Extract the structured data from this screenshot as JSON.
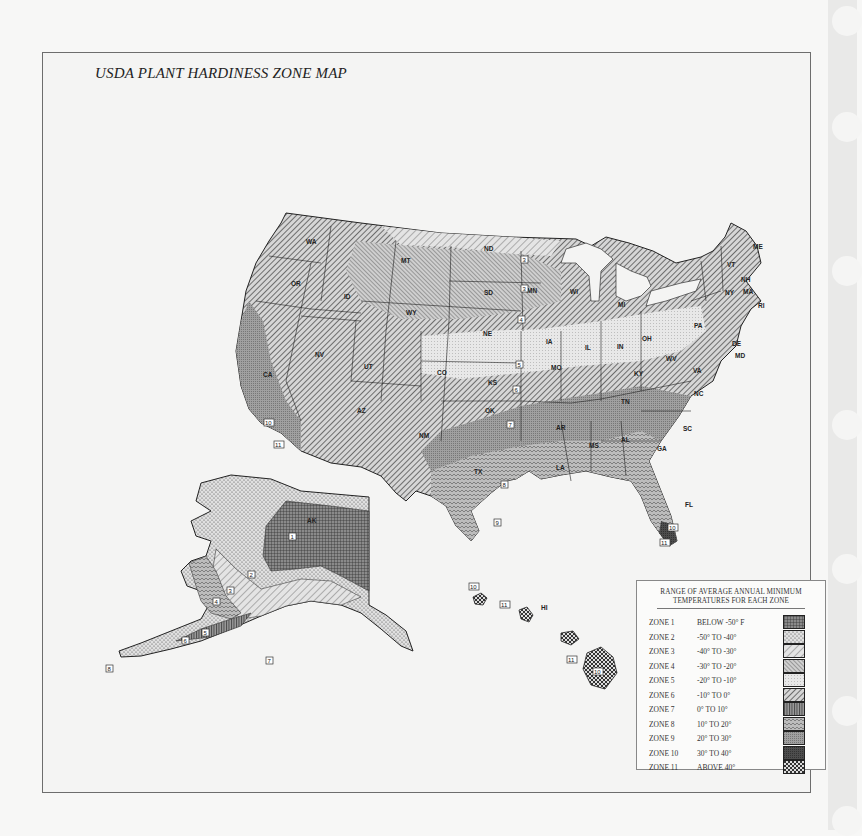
{
  "title": "USDA PLANT HARDINESS ZONE MAP",
  "colors": {
    "background": "#f7f7f6",
    "frame_border": "#6d6d6d",
    "sidebar": "#e9e9e8",
    "zone_shades": {
      "1": "#5c5c5c",
      "2": "#cfcfcf",
      "3": "#bdbdbd",
      "4": "#a8a8a8",
      "5": "#dedede",
      "6": "#c2c2c2",
      "7": "#7f7f7f",
      "8": "#a9a9a9",
      "9": "#959595",
      "10": "#4a4a4a",
      "11": "#6a6a6a"
    }
  },
  "legend": {
    "heading_line1": "RANGE OF AVERAGE ANNUAL MINIMUM",
    "heading_line2": "TEMPERATURES FOR EACH ZONE",
    "zones": [
      {
        "zone": "ZONE 1",
        "range": "BELOW  -50° F",
        "pattern": "grid"
      },
      {
        "zone": "ZONE 2",
        "range": "-50°  TO  -40°",
        "pattern": "dots"
      },
      {
        "zone": "ZONE 3",
        "range": "-40°  TO  -30°",
        "pattern": "sparse-diagonal"
      },
      {
        "zone": "ZONE 4",
        "range": "-30°  TO  -20°",
        "pattern": "dense-diagonal"
      },
      {
        "zone": "ZONE 5",
        "range": "-20°  TO  -10°",
        "pattern": "light-dots"
      },
      {
        "zone": "ZONE 6",
        "range": "-10°  TO   0°",
        "pattern": "heavy-diagonal"
      },
      {
        "zone": "ZONE 7",
        "range": "0°   TO  10°",
        "pattern": "vertical-lines"
      },
      {
        "zone": "ZONE 8",
        "range": "10°  TO  20°",
        "pattern": "wave"
      },
      {
        "zone": "ZONE 9",
        "range": "20°  TO  30°",
        "pattern": "fine-crosshatch"
      },
      {
        "zone": "ZONE 10",
        "range": "30°  TO  40°",
        "pattern": "dark-solid"
      },
      {
        "zone": "ZONE 11",
        "range": "ABOVE 40°",
        "pattern": "checker"
      }
    ]
  },
  "state_labels": [
    "WA",
    "OR",
    "ID",
    "MT",
    "ND",
    "SD",
    "WY",
    "NE",
    "MN",
    "WI",
    "MI",
    "IA",
    "IL",
    "IN",
    "OH",
    "PA",
    "NY",
    "VT",
    "NH",
    "ME",
    "MA",
    "RI",
    "DE",
    "MD",
    "WV",
    "VA",
    "KY",
    "TN",
    "NC",
    "SC",
    "GA",
    "AL",
    "MS",
    "AR",
    "LA",
    "TX",
    "OK",
    "KS",
    "MO",
    "CO",
    "NM",
    "AZ",
    "UT",
    "NV",
    "CA",
    "FL",
    "AK",
    "HI"
  ],
  "zone_markers": {
    "conus": [
      "3",
      "3",
      "4",
      "5",
      "6",
      "7",
      "8",
      "9",
      "10",
      "10",
      "11",
      "11"
    ],
    "alaska": [
      "1",
      "2",
      "3",
      "4",
      "5",
      "6",
      "7",
      "8"
    ],
    "hawaii": [
      "10",
      "11",
      "11",
      "10"
    ]
  }
}
